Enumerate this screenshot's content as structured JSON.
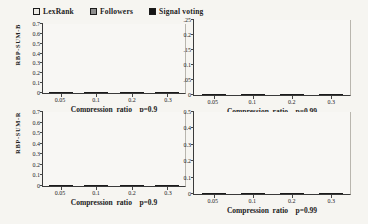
{
  "figure": {
    "background": "#f6f5f1",
    "text_color": "#222222"
  },
  "legend": {
    "items": [
      {
        "label": "LexRank",
        "color": "#eceae4",
        "pattern": "plain"
      },
      {
        "label": "Followers",
        "color": "#8d8d8d",
        "pattern": "hatch"
      },
      {
        "label": "Signal voting",
        "color": "#151515",
        "pattern": "plain"
      }
    ]
  },
  "chart_data": [
    {
      "type": "bar",
      "position": "top-left",
      "ylabel": "RBP-SUM-B",
      "xlabel": "Compression  ratio    p=0.9",
      "categories": [
        "0.05",
        "0.1",
        "0.2",
        "0.3"
      ],
      "ylim": [
        0,
        0.7
      ],
      "yticks": [
        "0",
        "0.1",
        "0.2",
        "0.3",
        "0.4",
        "0.5",
        "0.6",
        "0.7"
      ],
      "grid": false,
      "legend_position": "top",
      "series": [
        {
          "name": "LexRank",
          "color": "#eceae4",
          "pattern": "plain",
          "values": [
            0.4,
            0.41,
            0.43,
            0.41
          ]
        },
        {
          "name": "Followers",
          "color": "#8d8d8d",
          "pattern": "hatch",
          "values": [
            0.43,
            0.43,
            0.435,
            0.44
          ]
        },
        {
          "name": "Signal voting",
          "color": "#151515",
          "pattern": "plain",
          "values": [
            0.47,
            0.48,
            0.48,
            0.48
          ]
        }
      ]
    },
    {
      "type": "bar",
      "position": "top-right",
      "ylabel": "",
      "xlabel": "Compression  ratio    p=0.99",
      "categories": [
        "0.05",
        "0.1",
        "0.2",
        "0.3"
      ],
      "ylim": [
        0,
        0.25
      ],
      "yticks": [
        "0",
        ".05",
        "0.1",
        ".15",
        "0.2",
        ".25"
      ],
      "grid": false,
      "legend_position": "none",
      "series": [
        {
          "name": "LexRank",
          "color": "#eceae4",
          "pattern": "plain",
          "values": [
            0.115,
            0.145,
            0.165,
            0.18
          ]
        },
        {
          "name": "Followers",
          "color": "#8d8d8d",
          "pattern": "hatch",
          "values": [
            0.13,
            0.165,
            0.197,
            0.205
          ]
        },
        {
          "name": "Signal voting",
          "color": "#151515",
          "pattern": "plain",
          "values": [
            0.145,
            0.185,
            0.212,
            0.222
          ]
        }
      ]
    },
    {
      "type": "bar",
      "position": "bottom-left",
      "ylabel": "RBP-SUM-R",
      "xlabel": "Compression  ratio    p=0.9",
      "categories": [
        "0.05",
        "0.1",
        "0.2",
        "0.3"
      ],
      "ylim": [
        0,
        0.7
      ],
      "yticks": [
        "0",
        "0.1",
        "0.2",
        "0.3",
        "0.4",
        "0.5",
        "0.6",
        "0.7"
      ],
      "grid": false,
      "legend_position": "none",
      "series": [
        {
          "name": "LexRank",
          "color": "#eceae4",
          "pattern": "plain",
          "values": [
            0.46,
            0.475,
            0.5,
            0.47
          ]
        },
        {
          "name": "Followers",
          "color": "#8d8d8d",
          "pattern": "hatch",
          "values": [
            0.49,
            0.5,
            0.505,
            0.505
          ]
        },
        {
          "name": "Signal voting",
          "color": "#151515",
          "pattern": "plain",
          "values": [
            0.54,
            0.56,
            0.565,
            0.56
          ]
        }
      ]
    },
    {
      "type": "bar",
      "position": "bottom-right",
      "ylabel": "",
      "xlabel": "Compression  ratio    p=0.99",
      "categories": [
        "0.05",
        "0.1",
        "0.2",
        "0.3"
      ],
      "ylim": [
        0,
        0.5
      ],
      "yticks": [
        "0",
        "0.1",
        "0.2",
        "0.3",
        "0.4",
        "0.5"
      ],
      "grid": false,
      "legend_position": "none",
      "series": [
        {
          "name": "LexRank",
          "color": "#eceae4",
          "pattern": "plain",
          "values": [
            0.15,
            0.2,
            0.24,
            0.26
          ]
        },
        {
          "name": "Followers",
          "color": "#8d8d8d",
          "pattern": "hatch",
          "values": [
            0.165,
            0.225,
            0.275,
            0.29
          ]
        },
        {
          "name": "Signal voting",
          "color": "#151515",
          "pattern": "plain",
          "values": [
            0.185,
            0.25,
            0.3,
            0.315
          ]
        }
      ]
    }
  ]
}
